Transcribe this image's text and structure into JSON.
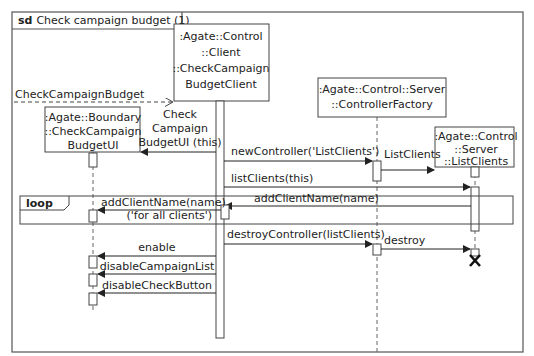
{
  "diagram": {
    "type": "sequence",
    "frame_keyword": "sd",
    "title": "Check campaign budget (1)",
    "lifelines": [
      {
        "id": "client",
        "lines": [
          ":Agate::Control",
          "::Client",
          "::CheckCampaign",
          "BudgetClient"
        ]
      },
      {
        "id": "boundary",
        "lines": [
          ":Agate::Boundary",
          "::CheckCampaign",
          "BudgetUI"
        ]
      },
      {
        "id": "factory",
        "lines": [
          ":Agate::Control::Server",
          "::ControllerFactory"
        ]
      },
      {
        "id": "listclients",
        "lines": [
          ":Agate::Control",
          "::Server",
          "::ListClients"
        ]
      }
    ],
    "messages": {
      "found": "CheckCampaignBudget",
      "create_ui": [
        "Check",
        "Campaign",
        "BudgetUI (this)"
      ],
      "new_controller": "newController('ListClients')",
      "create_listclients": "ListClients",
      "list_clients": "listClients(this)",
      "add_client_name_1": "addClientName(name)",
      "add_client_name_2": "addClientName(name)",
      "destroy_controller": "destroyController(listClients)",
      "destroy": "destroy",
      "enable": "enable",
      "disable_campaign_list": "disableCampaignList",
      "disable_check_button": "disableCheckButton"
    },
    "loop": {
      "keyword": "loop",
      "guard": "('for all clients')"
    },
    "colors": {
      "line": "#222222",
      "frame": "#555555",
      "background": "#ffffff"
    }
  }
}
